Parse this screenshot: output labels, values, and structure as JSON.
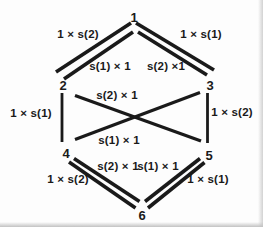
{
  "diagram": {
    "type": "graph",
    "background": "#fdfdfd",
    "ink_color": "#1a1a1a",
    "scan_edge_right_color": "#d2d2d2",
    "scan_edge_bottom_color": "#c2c2c2",
    "nodes": [
      {
        "id": "1",
        "label": "1",
        "x": 134,
        "y": 22
      },
      {
        "id": "2",
        "label": "2",
        "x": 63,
        "y": 90
      },
      {
        "id": "3",
        "label": "3",
        "x": 210,
        "y": 90
      },
      {
        "id": "4",
        "label": "4",
        "x": 66,
        "y": 158
      },
      {
        "id": "5",
        "label": "5",
        "x": 209,
        "y": 160
      },
      {
        "id": "6",
        "label": "6",
        "x": 142,
        "y": 220
      }
    ],
    "edges": [
      {
        "id": "1-2",
        "from": "1",
        "to": "2",
        "style": "double",
        "width": 3.6,
        "lines": [
          [
            131,
            23,
            56,
            72
          ],
          [
            133,
            32,
            64,
            79
          ]
        ],
        "labels": [
          {
            "text": "1 × s(2)",
            "x": 78,
            "y": 38
          },
          {
            "text": "s(1) × 1",
            "x": 110,
            "y": 70
          }
        ]
      },
      {
        "id": "1-3",
        "from": "1",
        "to": "3",
        "style": "double",
        "width": 3.6,
        "lines": [
          [
            136,
            23,
            214,
            70
          ],
          [
            138,
            32,
            207,
            75
          ]
        ],
        "labels": [
          {
            "text": "1 × s(1)",
            "x": 201,
            "y": 38
          },
          {
            "text": "s(2) ×1",
            "x": 166,
            "y": 70
          }
        ]
      },
      {
        "id": "2-4",
        "from": "2",
        "to": "4",
        "style": "single",
        "width": 2.8,
        "lines": [
          [
            62,
            93,
            62,
            142
          ]
        ],
        "labels": [
          {
            "text": "1 × s(1)",
            "x": 31,
            "y": 117
          }
        ]
      },
      {
        "id": "3-5",
        "from": "3",
        "to": "5",
        "style": "single",
        "width": 2.8,
        "lines": [
          [
            207.5,
            93,
            207.5,
            143
          ]
        ],
        "labels": [
          {
            "text": "1 × s(2)",
            "x": 232,
            "y": 116
          }
        ]
      },
      {
        "id": "2-5",
        "from": "2",
        "to": "5",
        "style": "single",
        "width": 3.2,
        "lines": [
          [
            75,
            95.5,
            201,
            141
          ]
        ],
        "labels": [
          {
            "text": "s(2) × 1",
            "x": 117,
            "y": 99
          }
        ]
      },
      {
        "id": "4-3",
        "from": "4",
        "to": "3",
        "style": "single",
        "width": 3.2,
        "lines": [
          [
            75,
            139.5,
            200,
            92.5
          ]
        ],
        "labels": [
          {
            "text": "s(1) × 1",
            "x": 119,
            "y": 144
          }
        ]
      },
      {
        "id": "4-6",
        "from": "4",
        "to": "6",
        "style": "double",
        "width": 3.6,
        "lines": [
          [
            69,
            162,
            135.5,
            208
          ],
          [
            74,
            158.5,
            139.5,
            201.5
          ]
        ],
        "labels": [
          {
            "text": "1 × s(2)",
            "x": 68,
            "y": 183
          },
          {
            "text": "s(2) × 1",
            "x": 118,
            "y": 170
          }
        ]
      },
      {
        "id": "5-6",
        "from": "5",
        "to": "6",
        "style": "double",
        "width": 3.6,
        "lines": [
          [
            204.5,
            162.5,
            148,
            208
          ],
          [
            200,
            158.5,
            145,
            201.5
          ]
        ],
        "labels": [
          {
            "text": "1 × s(1)",
            "x": 208,
            "y": 183
          },
          {
            "text": "s(1) × 1",
            "x": 158,
            "y": 170
          }
        ]
      }
    ]
  }
}
